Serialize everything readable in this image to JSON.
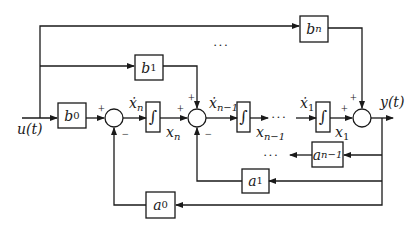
{
  "diagram": {
    "type": "block-diagram",
    "input": {
      "label": "u(t)"
    },
    "output": {
      "label": "y(t)"
    },
    "gains": {
      "b0": {
        "base": "b",
        "sub": "0"
      },
      "b1": {
        "base": "b",
        "sub": "1"
      },
      "bn": {
        "base": "b",
        "sub": "n"
      },
      "a0": {
        "base": "a",
        "sub": "0"
      },
      "a1": {
        "base": "a",
        "sub": "1"
      },
      "an1": {
        "base": "a",
        "sub": "n−1"
      }
    },
    "integrator_symbol": "∫",
    "signals": {
      "xn_dot": {
        "base": "ẋ",
        "sub": "n"
      },
      "xn": {
        "base": "x",
        "sub": "n"
      },
      "xn1_dot": {
        "base": "ẋ",
        "sub": "n−1"
      },
      "xn1": {
        "base": "x",
        "sub": "n−1"
      },
      "x1_dot": {
        "base": "ẋ",
        "sub": "1"
      },
      "x1": {
        "base": "x",
        "sub": "1"
      }
    },
    "signs": {
      "plus": "+",
      "minus": "−"
    },
    "ellipsis": "···"
  }
}
